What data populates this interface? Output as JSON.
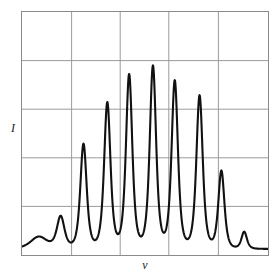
{
  "figure": {
    "background_color": "#ffffff",
    "frame_color": "#8b8b8b",
    "grid_color": "#9a9a9a",
    "curve_color": "#111111",
    "y_axis_label": "I",
    "x_axis_label": "ν"
  },
  "chart_data": {
    "type": "line",
    "title": "",
    "subtitle": "",
    "xlabel": "ν",
    "ylabel": "I",
    "xlim": [
      0,
      248
    ],
    "ylim": [
      0,
      1
    ],
    "grid": true,
    "grid_x_lines": [
      50,
      99,
      148,
      198
    ],
    "grid_y_lines": [
      0.2,
      0.4,
      0.6,
      0.8
    ],
    "legend": [],
    "legend_position": "none",
    "annotations": [],
    "baseline": 0.025,
    "peak_labels": [
      "p1",
      "p2",
      "p3",
      "p4",
      "p5",
      "p6",
      "p7",
      "p8",
      "p9",
      "p10",
      "p11"
    ],
    "x": [
      17,
      39,
      62,
      86,
      108,
      132,
      154,
      179,
      201,
      224
    ],
    "values": [
      0.075,
      0.155,
      0.455,
      0.625,
      0.74,
      0.775,
      0.715,
      0.655,
      0.345,
      0.095
    ],
    "peaks": [
      {
        "x": 17,
        "height": 0.075,
        "width": 11.0,
        "shape": "broad"
      },
      {
        "x": 39,
        "height": 0.155,
        "width": 5.0,
        "shape": "sharp"
      },
      {
        "x": 62,
        "height": 0.455,
        "width": 4.2,
        "shape": "sharp"
      },
      {
        "x": 86,
        "height": 0.625,
        "width": 4.2,
        "shape": "sharp"
      },
      {
        "x": 108,
        "height": 0.74,
        "width": 4.2,
        "shape": "sharp"
      },
      {
        "x": 132,
        "height": 0.775,
        "width": 4.2,
        "shape": "sharp"
      },
      {
        "x": 154,
        "height": 0.715,
        "width": 4.2,
        "shape": "sharp"
      },
      {
        "x": 179,
        "height": 0.655,
        "width": 4.2,
        "shape": "sharp"
      },
      {
        "x": 201,
        "height": 0.345,
        "width": 4.0,
        "shape": "sharp"
      },
      {
        "x": 224,
        "height": 0.095,
        "width": 3.6,
        "shape": "sharp"
      }
    ]
  }
}
